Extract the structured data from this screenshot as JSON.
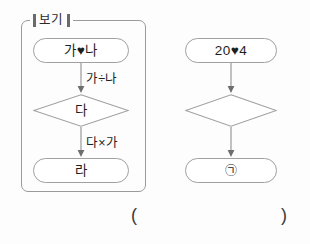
{
  "page": {
    "background_color": "#fdfdfd",
    "stroke_color": "#9a9a9a",
    "text_color": "#1e1e1e"
  },
  "example_box": {
    "label": "보기",
    "left_bracket": "▮",
    "right_bracket": "▮"
  },
  "left_flow": {
    "start": {
      "text": "가♥나"
    },
    "edge1": {
      "label": "가÷나"
    },
    "decision": {
      "text": "다"
    },
    "edge2": {
      "label": "다×가"
    },
    "end": {
      "text": "라"
    }
  },
  "right_flow": {
    "start": {
      "text": "20♥4"
    },
    "edge1": {
      "label": ""
    },
    "decision": {
      "text": ""
    },
    "edge2": {
      "label": ""
    },
    "end": {
      "text": "㉠"
    }
  },
  "answer_blank": {
    "open_paren": "(",
    "close_paren": ")"
  }
}
